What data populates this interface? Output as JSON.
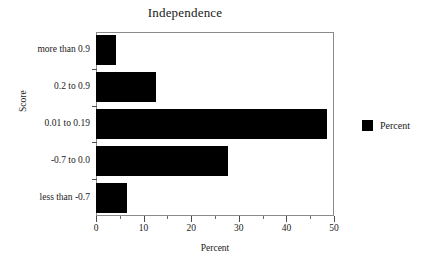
{
  "chart_data": {
    "type": "bar",
    "orientation": "horizontal",
    "title": "Independence",
    "xlabel": "Percent",
    "ylabel": "Score",
    "categories": [
      "more than 0.9",
      "0.2 to 0.9",
      "0.01 to 0.19",
      "-0.7 to 0.0",
      "less than -0.7"
    ],
    "values": [
      4.2,
      12.6,
      48.5,
      27.7,
      6.5
    ],
    "series": [
      {
        "name": "Percent",
        "values": [
          4.2,
          12.6,
          48.5,
          27.7,
          6.5
        ],
        "color": "#000000"
      }
    ],
    "xlim": [
      0,
      50
    ],
    "xticks": [
      0,
      10,
      20,
      30,
      40,
      50
    ],
    "xtick_labels": [
      "0",
      "10",
      "20",
      "30",
      "40",
      "50"
    ],
    "xminor_ticks": [
      5,
      15,
      25,
      35,
      45
    ],
    "grid": false,
    "legend": {
      "position": "right",
      "entries": [
        {
          "label": "Percent",
          "color": "#000000"
        }
      ]
    }
  },
  "legend": {
    "percent_label": "Percent"
  },
  "colors": {
    "bar": "#000000",
    "frame": "#8a8a8a",
    "text": "#1a1a1a",
    "background": "#ffffff"
  }
}
